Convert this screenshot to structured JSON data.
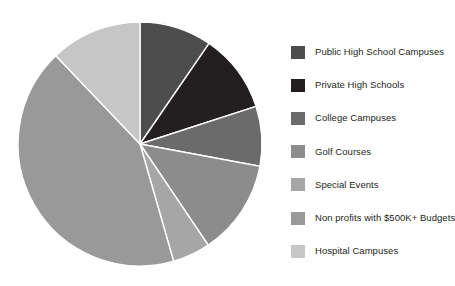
{
  "chart_data": {
    "type": "pie",
    "title": "",
    "subtitle": "",
    "xlabel": "",
    "ylabel": "",
    "grid": false,
    "legend_position": "right",
    "start_angle_deg": 0,
    "direction": "clockwise",
    "center": {
      "x": 140,
      "y": 144
    },
    "radius": 122,
    "categories": [
      "Public High School Campuses",
      "Private High Schools",
      "College Campuses",
      "Golf Courses",
      "Special Events",
      "Non profits with $500K+ Budgets",
      "Hospital Campuses"
    ],
    "values": [
      9.6,
      10.4,
      7.9,
      12.6,
      5.0,
      42.3,
      12.1
    ],
    "angles_deg": [
      34.5,
      37.5,
      28.5,
      45.5,
      18.0,
      152.4,
      43.6
    ],
    "colors": [
      "#4d4d4d",
      "#231f20",
      "#6b6b6b",
      "#8c8c8c",
      "#a6a6a6",
      "#999999",
      "#c6c6c6"
    ],
    "slice_edge_color": "#ffffff"
  },
  "legend": {
    "items": [
      {
        "label": "Public High School Campuses",
        "color": "#4d4d4d"
      },
      {
        "label": "Private High Schools",
        "color": "#231f20"
      },
      {
        "label": "College Campuses",
        "color": "#6b6b6b"
      },
      {
        "label": "Golf Courses",
        "color": "#8c8c8c"
      },
      {
        "label": "Special Events",
        "color": "#a6a6a6"
      },
      {
        "label": "Non profits with $500K+ Budgets",
        "color": "#999999"
      },
      {
        "label": "Hospital Campuses",
        "color": "#c6c6c6"
      }
    ]
  }
}
